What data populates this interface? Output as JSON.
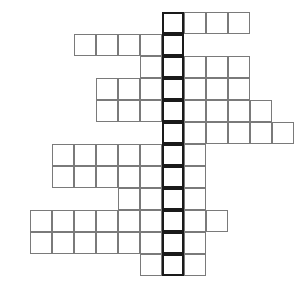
{
  "puzzle": {
    "type": "crossword-grid",
    "title": "Crossword Puzzle Grid",
    "cell_size": 22,
    "origin": {
      "x": 30,
      "y": 12
    },
    "key_column_index": 6,
    "colors": {
      "cell_border": "#7a7a7a",
      "key_border": "#1a1a1a",
      "cell_fill": "#ffffff",
      "number_text": "#1a1a1a",
      "background": "#ffffff"
    },
    "rows": [
      {
        "number": "1",
        "row_index": 0,
        "start_col": 6,
        "length": 4
      },
      {
        "number": "2",
        "row_index": 1,
        "start_col": 2,
        "length": 5
      },
      {
        "number": "3",
        "row_index": 2,
        "start_col": 5,
        "length": 5
      },
      {
        "number": "4",
        "row_index": 3,
        "start_col": 3,
        "length": 7
      },
      {
        "number": "5",
        "row_index": 4,
        "start_col": 3,
        "length": 8
      },
      {
        "number": "6",
        "row_index": 5,
        "start_col": 6,
        "length": 6
      },
      {
        "number": "7",
        "row_index": 6,
        "start_col": 1,
        "length": 7
      },
      {
        "number": "8",
        "row_index": 7,
        "start_col": 1,
        "length": 7
      },
      {
        "number": "9",
        "row_index": 8,
        "start_col": 4,
        "length": 4
      },
      {
        "number": "10",
        "row_index": 9,
        "start_col": 0,
        "length": 9
      },
      {
        "number": "11",
        "row_index": 10,
        "start_col": 0,
        "length": 8
      },
      {
        "number": "12",
        "row_index": 11,
        "start_col": 5,
        "length": 3
      }
    ]
  }
}
